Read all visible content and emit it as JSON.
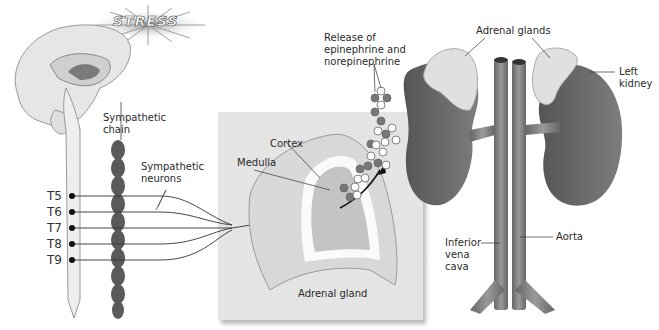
{
  "figure": {
    "stress_banner": "STRESS",
    "labels": {
      "sympathetic_chain": "Sympathetic\nchain",
      "sympathetic_neurons": "Sympathetic\nneurons",
      "release": "Release of\nepinephrine and\nnorepinephrine",
      "cortex": "Cortex",
      "medulla": "Medulla",
      "adrenal_gland": "Adrenal gland",
      "adrenal_glands": "Adrenal glands",
      "left_kidney": "Left\nkidney",
      "inferior_vena_cava": "Inferior\nvena\ncava",
      "aorta": "Aorta"
    },
    "spinal_levels": [
      "T5",
      "T6",
      "T7",
      "T8",
      "T9"
    ],
    "colors": {
      "brain": "#e6e6e6",
      "chain": "#5a5a5a",
      "panel": "#e4e4e4",
      "kidney": "#6b6b6b",
      "adrenal": "#e0e0e0",
      "vessel": "#7a7a7a"
    }
  }
}
